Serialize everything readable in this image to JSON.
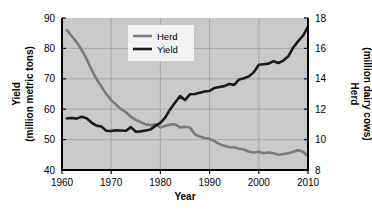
{
  "chart_data": {
    "type": "line",
    "title": "",
    "xlabel": "Year",
    "ylabel_left": "Yield\n(million metric tons)",
    "ylabel_left_line1": "Yield",
    "ylabel_left_line2": "(million metric tons)",
    "ylabel_right_line1": "Herd",
    "ylabel_right_line2": "(million dairy cows)",
    "xlim": [
      1960,
      2010
    ],
    "ylim_left": [
      40,
      90
    ],
    "ylim_right": [
      8,
      18
    ],
    "xticks": [
      1960,
      1970,
      1980,
      1990,
      2000,
      2010
    ],
    "xtick_labels": [
      "1960",
      "1970",
      "1980",
      "1990",
      "2000",
      "2010"
    ],
    "yticks_left": [
      40,
      50,
      60,
      70,
      80,
      90
    ],
    "ytick_labels_left": [
      "40",
      "50",
      "60",
      "70",
      "80",
      "90"
    ],
    "yticks_right": [
      8,
      10,
      12,
      14,
      16,
      18
    ],
    "ytick_labels_right": [
      "8",
      "10",
      "12",
      "14",
      "16",
      "18"
    ],
    "grid": true,
    "plot_background": "#c9c9c9",
    "legend_position": "top-center",
    "legend_background": "#f2f2f2",
    "series": [
      {
        "name": "Herd",
        "axis": "right",
        "color": "#7a7a7a",
        "units": "million dairy cows",
        "x": [
          1961,
          1962,
          1963,
          1964,
          1965,
          1966,
          1967,
          1968,
          1969,
          1970,
          1971,
          1972,
          1973,
          1974,
          1975,
          1976,
          1977,
          1978,
          1979,
          1980,
          1981,
          1982,
          1983,
          1984,
          1985,
          1986,
          1987,
          1988,
          1989,
          1990,
          1991,
          1992,
          1993,
          1994,
          1995,
          1996,
          1997,
          1998,
          1999,
          2000,
          2001,
          2002,
          2003,
          2004,
          2005,
          2006,
          2007,
          2008,
          2009,
          2010
        ],
        "values": [
          17.2,
          16.8,
          16.4,
          15.9,
          15.3,
          14.6,
          14.0,
          13.5,
          13.0,
          12.6,
          12.3,
          12.0,
          11.8,
          11.5,
          11.3,
          11.15,
          11.0,
          10.95,
          11.0,
          10.8,
          10.9,
          11.0,
          11.0,
          10.8,
          10.85,
          10.8,
          10.35,
          10.2,
          10.1,
          10.05,
          9.9,
          9.7,
          9.6,
          9.5,
          9.5,
          9.4,
          9.35,
          9.2,
          9.15,
          9.2,
          9.1,
          9.15,
          9.1,
          9.0,
          9.05,
          9.1,
          9.2,
          9.3,
          9.2,
          8.9
        ]
      },
      {
        "name": "Yield",
        "axis": "left",
        "color": "#1a1a1a",
        "units": "million metric tons",
        "x": [
          1961,
          1962,
          1963,
          1964,
          1965,
          1966,
          1967,
          1968,
          1969,
          1970,
          1971,
          1972,
          1973,
          1974,
          1975,
          1976,
          1977,
          1978,
          1979,
          1980,
          1981,
          1982,
          1983,
          1984,
          1985,
          1986,
          1987,
          1988,
          1989,
          1990,
          1991,
          1992,
          1993,
          1994,
          1995,
          1996,
          1997,
          1998,
          1999,
          2000,
          2001,
          2002,
          2003,
          2004,
          2005,
          2006,
          2007,
          2008,
          2009,
          2010
        ],
        "values": [
          57.0,
          57.1,
          56.9,
          57.5,
          57.0,
          55.6,
          54.6,
          54.3,
          52.9,
          52.8,
          53.1,
          53.0,
          52.9,
          54.1,
          52.6,
          52.7,
          53.0,
          53.3,
          54.6,
          55.5,
          57.3,
          60.0,
          62.2,
          64.3,
          63.0,
          64.9,
          65.0,
          65.4,
          65.8,
          66.0,
          67.0,
          67.3,
          67.6,
          68.3,
          68.0,
          69.8,
          70.2,
          70.8,
          72.2,
          74.6,
          74.8,
          75.0,
          75.8,
          75.2,
          76.0,
          77.4,
          80.3,
          82.4,
          84.2,
          87.2
        ]
      }
    ]
  },
  "legend": {
    "items": [
      {
        "label": "Herd",
        "color": "#7a7a7a"
      },
      {
        "label": "Yield",
        "color": "#1a1a1a"
      }
    ]
  }
}
